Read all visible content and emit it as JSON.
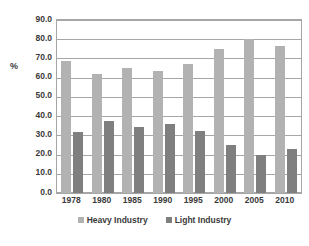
{
  "chart_data": {
    "type": "bar",
    "title": "",
    "subtitle": "",
    "xlabel": "",
    "ylabel": "%",
    "ylim": [
      0,
      90
    ],
    "ytick_step": 10,
    "grid": true,
    "legend_position": "bottom",
    "categories": [
      "1978",
      "1980",
      "1985",
      "1990",
      "1995",
      "2000",
      "2005",
      "2010"
    ],
    "ytick_labels": [
      "90.0",
      "80.0",
      "70.0",
      "60.0",
      "50.0",
      "40.0",
      "30.0",
      "20.0",
      "10.0",
      "0.0"
    ],
    "series": [
      {
        "name": "Heavy Industry",
        "color": "#b2b2b2",
        "values": [
          68.5,
          62.0,
          65.0,
          63.5,
          67.0,
          75.0,
          80.0,
          76.5
        ]
      },
      {
        "name": "Light Industry",
        "color": "#7f7f7f",
        "values": [
          31.5,
          37.5,
          34.5,
          36.0,
          32.5,
          25.0,
          20.0,
          23.0
        ]
      }
    ]
  },
  "legend": {
    "items": [
      {
        "label": "Heavy Industry",
        "swatch": "heavy-industry-swatch"
      },
      {
        "label": "Light Industry",
        "swatch": "light-industry-swatch"
      }
    ]
  },
  "axis": {
    "y_title": "%"
  },
  "colors": {
    "heavy_industry": "#b2b2b2",
    "light_industry": "#7f7f7f",
    "gridline": "#a6a6a6",
    "text": "#3a3a3a",
    "background": "#ffffff"
  }
}
